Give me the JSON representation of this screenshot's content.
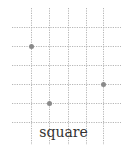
{
  "diagram": {
    "caption": "square",
    "grid": {
      "vertical_lines_x": [
        31,
        49,
        68,
        86,
        103
      ],
      "horizontal_lines_y": [
        27,
        46,
        65,
        84,
        103,
        122
      ],
      "x_extent": [
        12,
        121
      ],
      "y_extent": [
        8,
        145
      ],
      "line_color": "#b5b5b5",
      "line_style": "dotted"
    },
    "points": [
      {
        "x": 31,
        "y": 46
      },
      {
        "x": 103,
        "y": 84
      },
      {
        "x": 49,
        "y": 103
      }
    ],
    "point_color": "#8a8a8a",
    "point_radius": 2.5
  }
}
